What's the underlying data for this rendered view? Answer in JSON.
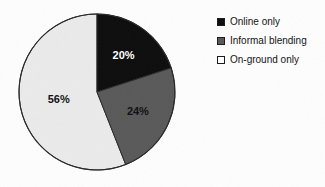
{
  "chart_data": {
    "type": "pie",
    "title": "",
    "categories": [
      "Online only",
      "Informal blending",
      "On-ground only"
    ],
    "values": [
      20,
      24,
      56
    ],
    "labels": [
      "20%",
      "24%",
      "56%"
    ],
    "units": "percent",
    "start_angle_deg": 0,
    "direction": "clockwise",
    "legend_position": "right",
    "grid": false,
    "colors": [
      "#0d0d0d",
      "#595959",
      "#eaeaea"
    ],
    "slices": [
      {
        "name": "Online only",
        "value": 20,
        "label": "20%",
        "color": "#0d0d0d",
        "label_color": "#ffffff"
      },
      {
        "name": "Informal blending",
        "value": 24,
        "label": "24%",
        "color": "#595959",
        "label_color": "#101010"
      },
      {
        "name": "On-ground only",
        "value": 56,
        "label": "56%",
        "color": "#eaeaea",
        "label_color": "#101010"
      }
    ]
  },
  "legend": {
    "items": [
      {
        "label": "Online only",
        "swatch": "#0d0d0d"
      },
      {
        "label": "Informal blending",
        "swatch": "#595959"
      },
      {
        "label": "On-ground only",
        "swatch": "#ffffff"
      }
    ]
  },
  "style": {
    "background": "#fdfdfd",
    "outline": "#2a2a2a"
  }
}
